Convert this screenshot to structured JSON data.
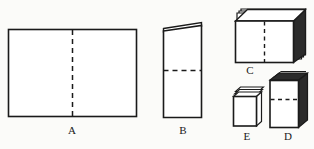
{
  "figure": {
    "background_color": "#fbfbf9",
    "stroke_color": "#1a1a1a",
    "fill_color": "#ffffff",
    "shade_color": "#2b2b2b",
    "panels": [
      {
        "id": "A",
        "label": "A",
        "description": "Unfolded flat rectangular sheet with vertical center dashed fold line",
        "shape": "flat-rectangle",
        "dashed_line": "vertical-center",
        "label_x": 72,
        "label_y": 131
      },
      {
        "id": "B",
        "label": "B",
        "description": "Sheet folded once in half, standing upright with thin folded top flap and horizontal dashed fold line",
        "shape": "folded-sheet",
        "dashed_line": "horizontal-center",
        "label_x": 183,
        "label_y": 131
      },
      {
        "id": "C",
        "label": "C",
        "description": "Folded stack shown in three-dimensional perspective with layered top edges and vertical dashed fold line",
        "shape": "stacked-block-wide",
        "dashed_line": "vertical-center",
        "label_x": 250,
        "label_y": 77
      },
      {
        "id": "D",
        "label": "D",
        "description": "Tall narrow folded block in three-dimensional perspective with dark layered top edges and horizontal dashed fold line",
        "shape": "stacked-block-tall",
        "dashed_line": "horizontal-upper",
        "label_x": 288,
        "label_y": 143
      },
      {
        "id": "E",
        "label": "E",
        "description": "Small compact folded block in three-dimensional perspective with layered top edges and no fold line",
        "shape": "stacked-block-small",
        "dashed_line": "none",
        "label_x": 247,
        "label_y": 143
      }
    ]
  }
}
